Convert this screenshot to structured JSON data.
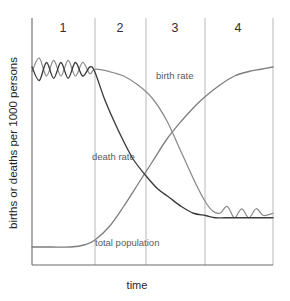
{
  "chart_data": {
    "type": "line",
    "title": "",
    "xlabel": "time",
    "ylabel": "births or deaths per 1000 persons",
    "grid": false,
    "legend_position": "inline-annotations",
    "xlim": [
      0,
      100
    ],
    "ylim": [
      0,
      100
    ],
    "stage_labels": [
      "1",
      "2",
      "3",
      "4"
    ],
    "stage_boundaries": [
      0,
      26,
      47,
      72,
      100
    ],
    "annotations": [
      {
        "text": "birth rate",
        "x": 48,
        "y": 72
      },
      {
        "text": "death rate",
        "x": 30,
        "y": 41
      },
      {
        "text": "total population",
        "x": 32,
        "y": 9
      }
    ],
    "series": [
      {
        "name": "birth rate",
        "color": "#8a8a8a",
        "description": "High and fluctuating in stage 1, remains high through stage 2, falls steeply in stage 3, low and fluctuating in stage 4",
        "points": [
          [
            0,
            86
          ],
          [
            3,
            92
          ],
          [
            6,
            84
          ],
          [
            9,
            91
          ],
          [
            12,
            84
          ],
          [
            15,
            91
          ],
          [
            18,
            84
          ],
          [
            21,
            90
          ],
          [
            24,
            85
          ],
          [
            26,
            87
          ],
          [
            32,
            86
          ],
          [
            38,
            84
          ],
          [
            44,
            80
          ],
          [
            50,
            74
          ],
          [
            56,
            64
          ],
          [
            62,
            50
          ],
          [
            68,
            36
          ],
          [
            72,
            28
          ],
          [
            75,
            24
          ],
          [
            78,
            23
          ],
          [
            81,
            26
          ],
          [
            84,
            21
          ],
          [
            87,
            25
          ],
          [
            90,
            21
          ],
          [
            93,
            25
          ],
          [
            96,
            22
          ],
          [
            100,
            23
          ]
        ]
      },
      {
        "name": "death rate",
        "color": "#3b3b3b",
        "description": "High and fluctuating in stage 1, falls rapidly in stage 2, continues falling slowly and levels off low in stages 3 and 4",
        "points": [
          [
            0,
            88
          ],
          [
            3,
            82
          ],
          [
            6,
            90
          ],
          [
            9,
            83
          ],
          [
            12,
            90
          ],
          [
            15,
            83
          ],
          [
            18,
            90
          ],
          [
            21,
            84
          ],
          [
            24,
            88
          ],
          [
            26,
            86
          ],
          [
            30,
            74
          ],
          [
            34,
            64
          ],
          [
            38,
            55
          ],
          [
            42,
            47
          ],
          [
            47,
            40
          ],
          [
            52,
            34
          ],
          [
            57,
            30
          ],
          [
            62,
            26
          ],
          [
            67,
            23
          ],
          [
            72,
            22
          ],
          [
            76,
            21
          ],
          [
            80,
            21
          ],
          [
            85,
            21
          ],
          [
            90,
            21
          ],
          [
            95,
            21
          ],
          [
            100,
            21
          ]
        ]
      },
      {
        "name": "total population",
        "color": "#7d7d7d",
        "description": "Low and stable in stage 1, rises rapidly through stages 2 and 3 in an S-curve, levels off high in stage 4",
        "points": [
          [
            0,
            8
          ],
          [
            8,
            8
          ],
          [
            16,
            8
          ],
          [
            22,
            9
          ],
          [
            26,
            11
          ],
          [
            32,
            17
          ],
          [
            38,
            26
          ],
          [
            44,
            36
          ],
          [
            50,
            46
          ],
          [
            56,
            56
          ],
          [
            62,
            64
          ],
          [
            68,
            71
          ],
          [
            72,
            75
          ],
          [
            78,
            80
          ],
          [
            84,
            84
          ],
          [
            90,
            86
          ],
          [
            95,
            87
          ],
          [
            100,
            88
          ]
        ]
      }
    ]
  },
  "axes": {
    "y_label": "births or deaths per 1000 persons",
    "x_label": "time"
  },
  "stages": [
    {
      "id": "stage-1",
      "label": "1"
    },
    {
      "id": "stage-2",
      "label": "2"
    },
    {
      "id": "stage-3",
      "label": "3"
    },
    {
      "id": "stage-4",
      "label": "4"
    }
  ],
  "series_labels": {
    "birth_rate": "birth rate",
    "death_rate": "death rate",
    "total_population": "total population"
  },
  "colors": {
    "birth_rate": "#8a8a8a",
    "death_rate": "#3b3b3b",
    "total_population": "#7d7d7d",
    "axis": "#6b6b6b",
    "divider": "#b9b9b9",
    "background": "#ffffff"
  }
}
